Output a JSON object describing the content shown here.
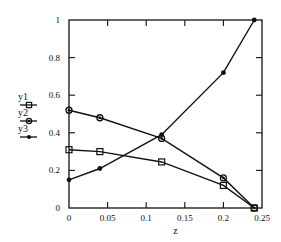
{
  "chart_data": {
    "type": "line",
    "title": "",
    "xlabel": "z",
    "ylabel": "",
    "xlim": [
      0,
      0.25
    ],
    "ylim": [
      0,
      1
    ],
    "xticks": [
      "0",
      "0.05",
      "0.1",
      "0.15",
      "0.2",
      "0.25"
    ],
    "yticks": [
      "0",
      "0.2",
      "0.4",
      "0.6",
      "0.8",
      "1"
    ],
    "grid": false,
    "legend_position": "left",
    "x": [
      0,
      0.04,
      0.12,
      0.2,
      0.24
    ],
    "series": [
      {
        "name": "y1",
        "marker": "square",
        "values": [
          0.31,
          0.3,
          0.245,
          0.12,
          0
        ]
      },
      {
        "name": "y2",
        "marker": "diamond",
        "values": [
          0.52,
          0.48,
          0.37,
          0.16,
          0
        ]
      },
      {
        "name": "y3",
        "marker": "circle",
        "values": [
          0.15,
          0.21,
          0.39,
          0.72,
          1.0
        ]
      }
    ]
  },
  "colors": {
    "line": "#111111",
    "background": "#ffffff"
  }
}
